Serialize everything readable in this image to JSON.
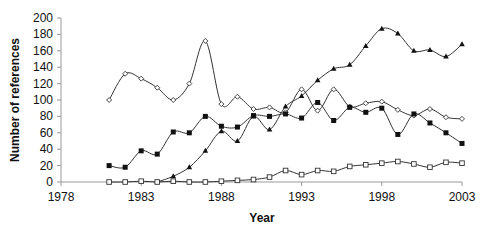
{
  "chart_data": {
    "type": "line",
    "title": "",
    "xlabel": "Year",
    "ylabel": "Number of references",
    "xlim": [
      1978,
      2003
    ],
    "ylim": [
      0,
      200
    ],
    "x_ticks": [
      1978,
      1983,
      1988,
      1993,
      1998,
      2003
    ],
    "y_ticks": [
      0,
      20,
      40,
      60,
      80,
      100,
      120,
      140,
      160,
      180,
      200
    ],
    "grid": false,
    "legend": "none",
    "series": [
      {
        "name": "open diamond",
        "marker": "diamond-open",
        "x": [
          1981,
          1982,
          1983,
          1984,
          1985,
          1986,
          1987,
          1988,
          1989,
          1990,
          1991,
          1992,
          1993,
          1994,
          1995,
          1996,
          1997,
          1998,
          1999,
          2000,
          2001,
          2002,
          2003
        ],
        "values": [
          100,
          132,
          126,
          115,
          100,
          120,
          172,
          95,
          104,
          89,
          91,
          85,
          113,
          87,
          113,
          92,
          96,
          98,
          88,
          81,
          89,
          79,
          77
        ]
      },
      {
        "name": "filled square",
        "marker": "square-filled",
        "x": [
          1981,
          1982,
          1983,
          1984,
          1985,
          1986,
          1987,
          1988,
          1989,
          1990,
          1991,
          1992,
          1993,
          1994,
          1995,
          1996,
          1997,
          1998,
          1999,
          2000,
          2001,
          2002,
          2003
        ],
        "values": [
          20,
          18,
          38,
          34,
          61,
          60,
          80,
          68,
          67,
          81,
          80,
          83,
          78,
          97,
          75,
          91,
          85,
          90,
          58,
          83,
          72,
          60,
          47
        ]
      },
      {
        "name": "filled triangle",
        "marker": "triangle-filled",
        "x": [
          1984,
          1985,
          1986,
          1987,
          1988,
          1989,
          1990,
          1991,
          1992,
          1993,
          1994,
          1995,
          1996,
          1997,
          1998,
          1999,
          2000,
          2001,
          2002,
          2003
        ],
        "values": [
          0,
          7,
          18,
          38,
          62,
          50,
          80,
          64,
          92,
          105,
          124,
          138,
          143,
          166,
          187,
          181,
          160,
          161,
          153,
          168
        ]
      },
      {
        "name": "open square",
        "marker": "square-open",
        "x": [
          1981,
          1982,
          1983,
          1984,
          1985,
          1986,
          1987,
          1988,
          1989,
          1990,
          1991,
          1992,
          1993,
          1994,
          1995,
          1996,
          1997,
          1998,
          1999,
          2000,
          2001,
          2002,
          2003
        ],
        "values": [
          0,
          0,
          1,
          0,
          1,
          0,
          0,
          1,
          2,
          3,
          6,
          14,
          9,
          14,
          13,
          19,
          21,
          23,
          25,
          22,
          18,
          24,
          23
        ]
      }
    ]
  }
}
